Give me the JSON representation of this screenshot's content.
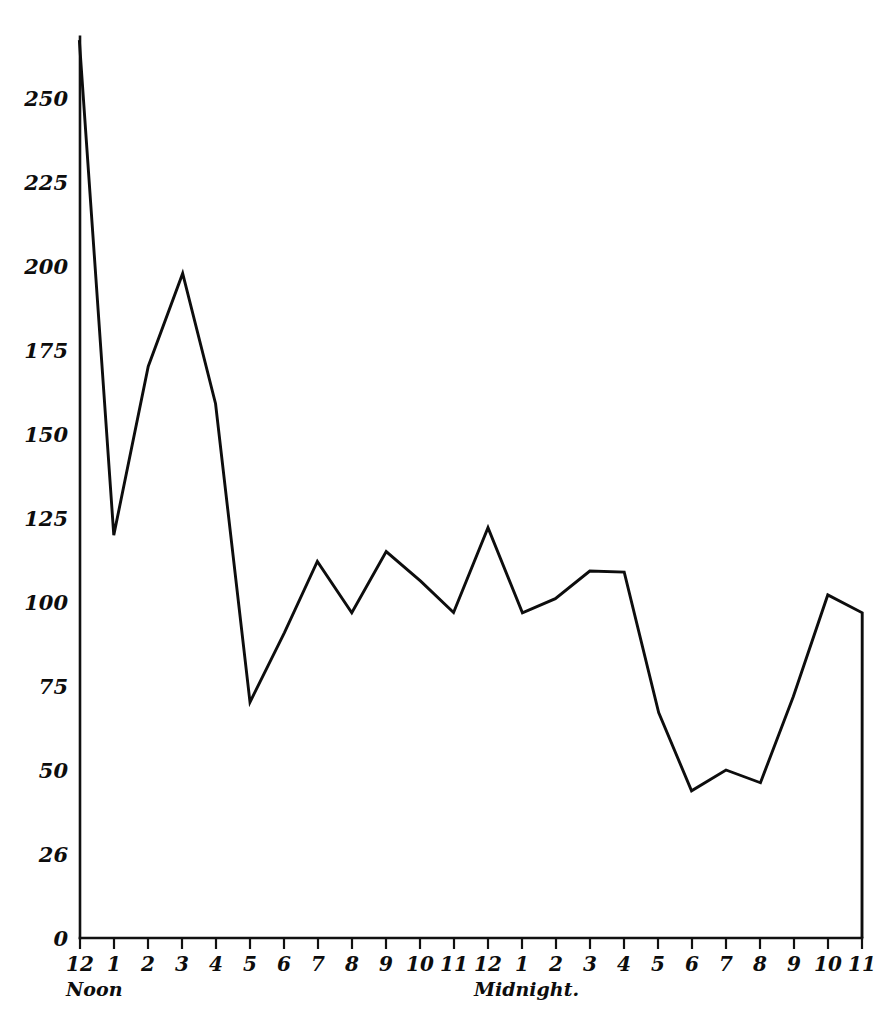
{
  "chart_data": {
    "type": "line",
    "title": "",
    "subtitle": "",
    "xlabel": "",
    "ylabel": "",
    "grid": false,
    "legend": "none",
    "line_color": "#0d0d0d",
    "background_color": "#ffffff",
    "ylim": [
      0,
      270
    ],
    "y_ticks": [
      0,
      25,
      50,
      75,
      100,
      125,
      150,
      175,
      200,
      225,
      250
    ],
    "y_tick_labels": [
      "0",
      "26",
      "50",
      "75",
      "100",
      "125",
      "150",
      "175",
      "200",
      "225",
      "250"
    ],
    "x_tick_labels": [
      "12",
      "1",
      "2",
      "3",
      "4",
      "5",
      "6",
      "7",
      "8",
      "9",
      "10",
      "11",
      "12",
      "1",
      "2",
      "3",
      "4",
      "5",
      "6",
      "7",
      "8",
      "9",
      "10",
      "11"
    ],
    "x_anchor_labels": [
      {
        "at_index": 0,
        "text": "Noon"
      },
      {
        "at_index": 12,
        "text": "Midnight."
      }
    ],
    "categories": [
      "12 Noon",
      "1",
      "2",
      "3",
      "4",
      "5",
      "6",
      "7",
      "8",
      "9",
      "10",
      "11",
      "12 Midnight",
      "1",
      "2",
      "3",
      "4",
      "5",
      "6",
      "7",
      "8",
      "9",
      "10",
      "11"
    ],
    "values": [
      267,
      120,
      170,
      198,
      159,
      70,
      91,
      112,
      97,
      115,
      106,
      97,
      122,
      97,
      101,
      109,
      109,
      67,
      44,
      50,
      46,
      72,
      102,
      97
    ],
    "drops_to_zero_at_end": true,
    "starts_at_axis_top": true
  },
  "axis": {
    "y_axis_name": "vertical-axis",
    "x_axis_name": "horizontal-axis"
  }
}
